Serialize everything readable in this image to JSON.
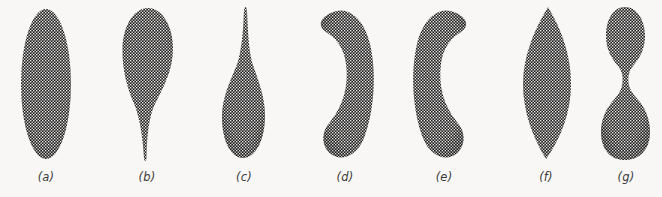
{
  "figure": {
    "background_color": "#f8f7f5",
    "ink_color": "#1e1e1e",
    "texture": "halftone-checkerboard-dots",
    "caption_style": "italic-parenthesized-letter",
    "panel_count": 7
  },
  "panels": [
    {
      "id": "a",
      "label": "(a)",
      "shape_name": "ellipse",
      "description": "Smooth symmetric ellipse, long axis vertical",
      "center_x": 45,
      "center_y": 84,
      "width": 50,
      "height": 150,
      "caption_x": 45
    },
    {
      "id": "b",
      "label": "(b)",
      "shape_name": "teardrop-down",
      "description": "Broad rounded bulb at top tapering to a narrow tail at bottom",
      "center_x": 146,
      "center_y": 84,
      "width": 54,
      "height": 155,
      "caption_x": 146
    },
    {
      "id": "c",
      "label": "(c)",
      "shape_name": "teardrop-up",
      "description": "Narrow spike at top widening to a rounded bulb at bottom",
      "center_x": 243,
      "center_y": 86,
      "width": 46,
      "height": 155,
      "caption_x": 243
    },
    {
      "id": "d",
      "label": "(d)",
      "shape_name": "crescent-right",
      "description": "Banana-shaped crescent bulging to the right, concave on the left",
      "center_x": 340,
      "center_y": 84,
      "width": 64,
      "height": 152,
      "caption_x": 345
    },
    {
      "id": "e",
      "label": "(e)",
      "shape_name": "crescent-left",
      "description": "Banana-shaped crescent bulging to the left, concave on the right",
      "center_x": 443,
      "center_y": 84,
      "width": 64,
      "height": 152,
      "caption_x": 443
    },
    {
      "id": "f",
      "label": "(f)",
      "shape_name": "lens-vesica",
      "description": "Lens or vesica shape, pointed at top and bottom, widest at the middle",
      "center_x": 545,
      "center_y": 84,
      "width": 62,
      "height": 155,
      "caption_x": 545
    },
    {
      "id": "g",
      "label": "(g)",
      "shape_name": "dumbbell-peanut",
      "description": "Two-lobed dumbbell with a narrow waist; smaller lobe above, larger lobe below",
      "center_x": 624,
      "center_y": 84,
      "width": 46,
      "height": 155,
      "caption_x": 624
    }
  ]
}
